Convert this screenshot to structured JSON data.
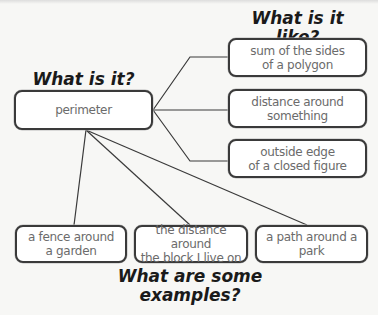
{
  "diagram": {
    "type": "concept-map",
    "headings": {
      "what_is_it": "What is it?",
      "what_is_it_like": "What is it like?",
      "examples": "What are some\nexamples?"
    },
    "central_node": {
      "label": "perimeter"
    },
    "like_nodes": [
      {
        "label": "sum of the sides\nof a polygon"
      },
      {
        "label": "distance around\nsomething"
      },
      {
        "label": "outside edge\nof a closed figure"
      }
    ],
    "example_nodes": [
      {
        "label": "a fence around\na garden"
      },
      {
        "label": "the distance around\nthe block I live on"
      },
      {
        "label": "a path around a park"
      }
    ],
    "colors": {
      "background": "#f7f7f5",
      "box_border": "#3a3a3a",
      "box_fill": "#ffffff",
      "box_text": "#6b6b6b",
      "heading_text": "#1a1a1a",
      "line": "#3a3a3a"
    }
  }
}
